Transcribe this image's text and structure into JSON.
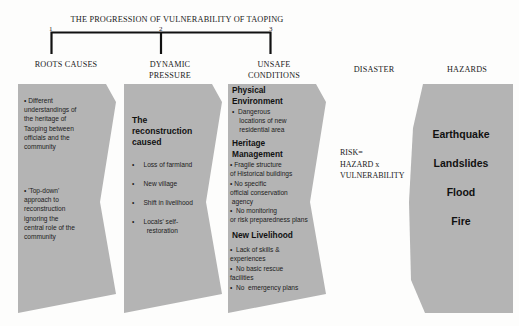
{
  "title": "THE PROGRESSION OF VULNERABILITY OF TAOPING",
  "ticks": [
    "1",
    "2",
    "3"
  ],
  "colors": {
    "shape_fill": "#b4b4b4",
    "background": "#fdfdfc",
    "text": "#1a1a1a",
    "bracket": "#111111"
  },
  "columns": [
    {
      "header": "ROOTS CAUSES",
      "groups": [
        {
          "heading": "",
          "bullets": [
            "• Different\nunderstandings of\nthe heritage of\nTaoping between\nofficials and the\ncommunity",
            "• 'Top-down'\napproach to\nreconstruction\nignoring the\ncentral role of the\ncommunity"
          ]
        }
      ]
    },
    {
      "header": "DYNAMIC\nPRESSURE",
      "groups": [
        {
          "heading": "The\nreconstruction\ncaused",
          "bullets": [
            "•     Loss of farmland",
            "•     New village",
            "•     Shift in livelihood",
            "•     Locals' self-\n        restoration"
          ]
        }
      ]
    },
    {
      "header": "UNSAFE\nCONDITIONS",
      "groups": [
        {
          "heading": "Physical\nEnvironment",
          "bullets": [
            "•  Dangerous\n    locations of new\n    residential area"
          ]
        },
        {
          "heading": "Heritage\nManagement",
          "bullets": [
            "• Fragile structure\nof Historical buildings",
            "• No specific\nofficial conservation\n agency",
            "•  No monitoring\nor risk preparedness plans"
          ]
        },
        {
          "heading": "New Livelihood",
          "bullets": [
            "•  Lack of skills &\nexperiences",
            "•  No basic rescue\nfacilities",
            "•  No  emergency plans"
          ]
        }
      ]
    },
    {
      "header": "DISASTER",
      "equation": "RISK=\nHAZARD x\nVULNERABILITY"
    },
    {
      "header": "HAZARDS",
      "hazards": [
        "Earthquake",
        "Landslides",
        "Flood",
        "Fire"
      ]
    }
  ]
}
